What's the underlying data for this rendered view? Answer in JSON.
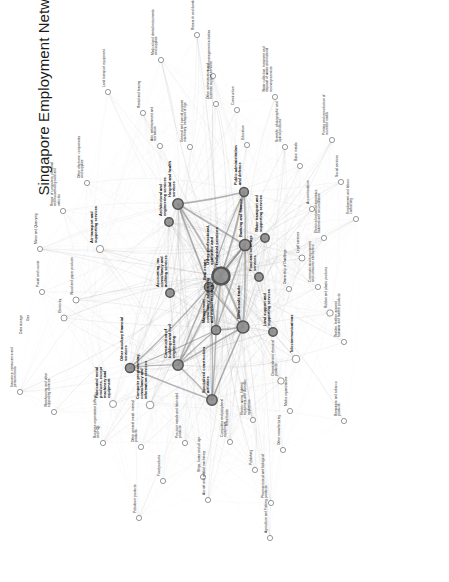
{
  "figure": {
    "title": "Singapore Employment Network",
    "background": "#ffffff",
    "width": 449,
    "height": 582,
    "title_rotation_deg": -90,
    "node_fill_large": "#8c8c8c",
    "node_fill_small": "#ffffff",
    "node_stroke": "#555555",
    "edge_color": "#9a9a9a",
    "label_color": "#111111"
  },
  "chart_data": {
    "type": "network",
    "title": "Singapore Employment Network",
    "layout": "force-directed",
    "grid": false,
    "legend": null,
    "xlabel": "",
    "ylabel": "",
    "node_count": 63,
    "nodes": [
      {
        "id": "prof_scientific",
        "label": "Other professional, scientific and technical services",
        "x": 221,
        "y": 276,
        "r": 8.5,
        "weight": 100,
        "emphasis": "big"
      },
      {
        "id": "hospital_health",
        "label": "Hospital and health services",
        "x": 178,
        "y": 204,
        "r": 5.2,
        "weight": 62,
        "emphasis": "mid"
      },
      {
        "id": "public_admin",
        "label": "Public administration and defence",
        "x": 244,
        "y": 192,
        "r": 4.4,
        "weight": 54,
        "emphasis": "mid"
      },
      {
        "id": "wholesale_trade",
        "label": "Wholesale trade",
        "x": 243,
        "y": 327,
        "r": 6.0,
        "weight": 78,
        "emphasis": "big"
      },
      {
        "id": "banking_finance",
        "label": "Banking and finance",
        "x": 245,
        "y": 245,
        "r": 5.6,
        "weight": 70,
        "emphasis": "mid"
      },
      {
        "id": "real_estate",
        "label": "Real estate",
        "x": 209,
        "y": 287,
        "r": 4.6,
        "weight": 52,
        "emphasis": "mid"
      },
      {
        "id": "mgmt_consultancy",
        "label": "Management consultancy, advertising and market research",
        "x": 216,
        "y": 330,
        "r": 4.6,
        "weight": 50,
        "emphasis": "mid"
      },
      {
        "id": "construction_buildings",
        "label": "Construction of buildings and civil engineering",
        "x": 178,
        "y": 365,
        "r": 5.2,
        "weight": 60,
        "emphasis": "mid"
      },
      {
        "id": "specialized_construction",
        "label": "Specialized construction activities",
        "x": 212,
        "y": 400,
        "r": 5.2,
        "weight": 58,
        "emphasis": "mid"
      },
      {
        "id": "other_aux_financial",
        "label": "Other auxiliary financial services",
        "x": 130,
        "y": 368,
        "r": 4.6,
        "weight": 48,
        "emphasis": "mid"
      },
      {
        "id": "architectural_eng",
        "label": "Architectural and engineering services",
        "x": 169,
        "y": 222,
        "r": 4.2,
        "weight": 44,
        "emphasis": "mid"
      },
      {
        "id": "accounting_tax",
        "label": "Accounting, tax consultancy and auditing services",
        "x": 170,
        "y": 293,
        "r": 4.2,
        "weight": 42,
        "emphasis": "mid"
      },
      {
        "id": "food_beverage",
        "label": "Food and beverage services",
        "x": 259,
        "y": 277,
        "r": 4.2,
        "weight": 42,
        "emphasis": "mid"
      },
      {
        "id": "water_transport",
        "label": "Water transport and supporting services",
        "x": 265,
        "y": 238,
        "r": 4.2,
        "weight": 40,
        "emphasis": "mid"
      },
      {
        "id": "land_support",
        "label": "Land support and supporting services",
        "x": 273,
        "y": 332,
        "r": 4.2,
        "weight": 40,
        "emphasis": "mid"
      },
      {
        "id": "telecommunications",
        "label": "Telecommunications",
        "x": 296,
        "y": 359,
        "r": 3.8,
        "weight": 36,
        "emphasis": "mid"
      },
      {
        "id": "computer_programming",
        "label": "Computer programming, consultancy and information services",
        "x": 150,
        "y": 405,
        "r": 3.8,
        "weight": 36,
        "emphasis": "mid"
      },
      {
        "id": "fabricated_metal",
        "label": "Fabricated metal products, except machinery and equipment",
        "x": 113,
        "y": 404,
        "r": 3.5,
        "weight": 30,
        "emphasis": "mid"
      },
      {
        "id": "air_transport",
        "label": "Air transport and supporting services",
        "x": 100,
        "y": 249,
        "r": 3.6,
        "weight": 32,
        "emphasis": "mid"
      },
      {
        "id": "rubber_plastic",
        "label": "Rubber and plastic products",
        "x": 330,
        "y": 313,
        "r": 3.2,
        "weight": 24,
        "emphasis": "small"
      },
      {
        "id": "chemicals",
        "label": "Chemicals and chemical products",
        "x": 281,
        "y": 381,
        "r": 3.2,
        "weight": 24,
        "emphasis": "small"
      },
      {
        "id": "legal_services",
        "label": "Legal services",
        "x": 302,
        "y": 258,
        "r": 3.0,
        "weight": 22,
        "emphasis": "small"
      },
      {
        "id": "electricity",
        "label": "Electricity",
        "x": 64,
        "y": 318,
        "r": 3.0,
        "weight": 20,
        "emphasis": "small"
      },
      {
        "id": "wood_paper",
        "label": "Wood and paper products",
        "x": 76,
        "y": 300,
        "r": 3.0,
        "weight": 20,
        "emphasis": "small"
      },
      {
        "id": "postal_courier",
        "label": "Postal and courier",
        "x": 42,
        "y": 292,
        "r": 2.6,
        "weight": 16,
        "emphasis": "small"
      },
      {
        "id": "mines_quarrying",
        "label": "Mines and Quarrying",
        "x": 40,
        "y": 249,
        "r": 2.6,
        "weight": 14,
        "emphasis": "small"
      },
      {
        "id": "repair_computers",
        "label": "Repair of computers, personal and household goods and vehicles",
        "x": 63,
        "y": 211,
        "r": 2.6,
        "weight": 14,
        "emphasis": "small"
      },
      {
        "id": "other_electronic",
        "label": "Other electronic components and supplies",
        "x": 87,
        "y": 183,
        "r": 2.6,
        "weight": 14,
        "emphasis": "small"
      },
      {
        "id": "land_transport_equipment",
        "label": "Land transport equipment",
        "x": 108,
        "y": 92,
        "r": 2.6,
        "weight": 14,
        "emphasis": "small"
      },
      {
        "id": "medical_dental",
        "label": "Medical and dental instruments and supplies",
        "x": 161,
        "y": 60,
        "r": 2.6,
        "weight": 14,
        "emphasis": "small"
      },
      {
        "id": "rental_leasing",
        "label": "Rental and leasing",
        "x": 143,
        "y": 113,
        "r": 2.6,
        "weight": 14,
        "emphasis": "small"
      },
      {
        "id": "arts_entertainment",
        "label": "Arts, entertainment and recreation",
        "x": 160,
        "y": 146,
        "r": 2.6,
        "weight": 14,
        "emphasis": "small"
      },
      {
        "id": "research_development",
        "label": "Research and development",
        "x": 197,
        "y": 35,
        "r": 2.6,
        "weight": 14,
        "emphasis": "small"
      },
      {
        "id": "fund_management",
        "label": "Fund management activities",
        "x": 213,
        "y": 76,
        "r": 2.6,
        "weight": 14,
        "emphasis": "small"
      },
      {
        "id": "other_admin_support",
        "label": "Other administrative and business support services",
        "x": 216,
        "y": 104,
        "r": 2.6,
        "weight": 14,
        "emphasis": "small"
      },
      {
        "id": "general_special_machinery",
        "label": "General and special purpose machinery, transport of rigs",
        "x": 190,
        "y": 147,
        "r": 2.6,
        "weight": 14,
        "emphasis": "small"
      },
      {
        "id": "construction_misc",
        "label": "Construction",
        "x": 237,
        "y": 110,
        "r": 2.6,
        "weight": 14,
        "emphasis": "small"
      },
      {
        "id": "education",
        "label": "Education",
        "x": 247,
        "y": 145,
        "r": 2.6,
        "weight": 14,
        "emphasis": "small"
      },
      {
        "id": "water_collection",
        "label": "Water collection, treatment and disposal of waste and material recovery services",
        "x": 275,
        "y": 97,
        "r": 2.6,
        "weight": 14,
        "emphasis": "small"
      },
      {
        "id": "scientific_photographic",
        "label": "Scientific, photographic and optical products",
        "x": 285,
        "y": 147,
        "r": 2.6,
        "weight": 14,
        "emphasis": "small"
      },
      {
        "id": "basic_metals",
        "label": "Basic metals",
        "x": 300,
        "y": 166,
        "r": 2.6,
        "weight": 14,
        "emphasis": "small"
      },
      {
        "id": "printing_reproduction",
        "label": "Printing and reproduction of recorded media",
        "x": 332,
        "y": 140,
        "r": 2.6,
        "weight": 14,
        "emphasis": "small"
      },
      {
        "id": "social_services",
        "label": "Social services",
        "x": 341,
        "y": 182,
        "r": 2.6,
        "weight": 14,
        "emphasis": "small"
      },
      {
        "id": "accommodation",
        "label": "Accommodation",
        "x": 312,
        "y": 209,
        "r": 2.6,
        "weight": 14,
        "emphasis": "small"
      },
      {
        "id": "electrical_industrial",
        "label": "Electrical industrial apparatus, batteries and accumulators",
        "x": 324,
        "y": 238,
        "r": 2.6,
        "weight": 14,
        "emphasis": "small"
      },
      {
        "id": "employment_labour",
        "label": "Employment and labour contracting",
        "x": 356,
        "y": 219,
        "r": 2.6,
        "weight": 14,
        "emphasis": "small"
      },
      {
        "id": "communications_equipment",
        "label": "Communications equipment and consumer electronics",
        "x": 318,
        "y": 287,
        "r": 2.6,
        "weight": 14,
        "emphasis": "small"
      },
      {
        "id": "ownership_dwellings",
        "label": "Ownership of Dwellings",
        "x": 289,
        "y": 289,
        "r": 2.6,
        "weight": 14,
        "emphasis": "small"
      },
      {
        "id": "textiles_leather",
        "label": "Textiles, leather, apparel, footwear and leather products",
        "x": 344,
        "y": 342,
        "r": 2.6,
        "weight": 14,
        "emphasis": "small"
      },
      {
        "id": "beverages_tobacco",
        "label": "Beverages and tobacco products",
        "x": 344,
        "y": 421,
        "r": 2.6,
        "weight": 14,
        "emphasis": "small"
      },
      {
        "id": "media_organizations",
        "label": "Media organizations",
        "x": 290,
        "y": 411,
        "r": 2.6,
        "weight": 14,
        "emphasis": "small"
      },
      {
        "id": "electric_wiring",
        "label": "Electric wiring, lighting equipment and domestic appliances",
        "x": 253,
        "y": 420,
        "r": 2.6,
        "weight": 14,
        "emphasis": "small"
      },
      {
        "id": "computers_peripheral",
        "label": "Computers and peripheral equipment",
        "x": 230,
        "y": 442,
        "r": 2.6,
        "weight": 14,
        "emphasis": "small"
      },
      {
        "id": "publishing",
        "label": "Publishing",
        "x": 255,
        "y": 470,
        "r": 2.6,
        "weight": 14,
        "emphasis": "small"
      },
      {
        "id": "other_manufacturing",
        "label": "Other manufacturing",
        "x": 283,
        "y": 450,
        "r": 2.6,
        "weight": 14,
        "emphasis": "small"
      },
      {
        "id": "pharmaceutical",
        "label": "Pharmaceutical and biological products",
        "x": 271,
        "y": 503,
        "r": 2.6,
        "weight": 14,
        "emphasis": "small"
      },
      {
        "id": "agriculture_fishing",
        "label": "Agriculture and Fishing",
        "x": 270,
        "y": 538,
        "r": 2.6,
        "weight": 14,
        "emphasis": "small"
      },
      {
        "id": "aircraft_machinery",
        "label": "Aircraft and related machinery",
        "x": 208,
        "y": 500,
        "r": 2.6,
        "weight": 14,
        "emphasis": "small"
      },
      {
        "id": "ships_rigs",
        "label": "Ships, boats and oil rigs",
        "x": 203,
        "y": 477,
        "r": 2.6,
        "weight": 14,
        "emphasis": "small"
      },
      {
        "id": "precious_metals",
        "label": "Precious metals and fabricated products",
        "x": 185,
        "y": 443,
        "r": 2.6,
        "weight": 14,
        "emphasis": "small"
      },
      {
        "id": "food_products",
        "label": "Food products",
        "x": 163,
        "y": 481,
        "r": 2.6,
        "weight": 14,
        "emphasis": "small"
      },
      {
        "id": "petroleum_products",
        "label": "Petroleum products",
        "x": 139,
        "y": 518,
        "r": 2.6,
        "weight": 14,
        "emphasis": "small"
      },
      {
        "id": "other_mineral_products",
        "label": "Other general metal, mineral products",
        "x": 141,
        "y": 447,
        "r": 2.6,
        "weight": 14,
        "emphasis": "small"
      },
      {
        "id": "business_org_hq",
        "label": "Business organization (offices and HQ)",
        "x": 103,
        "y": 443,
        "r": 2.6,
        "weight": 14,
        "emphasis": "small"
      },
      {
        "id": "warehousing",
        "label": "Warehousing and other supporting services",
        "x": 54,
        "y": 412,
        "r": 2.6,
        "weight": 14,
        "emphasis": "small"
      },
      {
        "id": "insurance_pension",
        "label": "Insurance, reinsurance and pension funds",
        "x": 20,
        "y": 392,
        "r": 2.6,
        "weight": 14,
        "emphasis": "small"
      },
      {
        "id": "retail_trade",
        "label": "Retail trade",
        "x": 231,
        "y": 428,
        "r": 0,
        "weight": 0,
        "emphasis": "small"
      },
      {
        "id": "data_storage",
        "label": "Data storage",
        "x": 25,
        "y": 336,
        "r": 0,
        "weight": 0,
        "emphasis": "small"
      },
      {
        "id": "gas_supply",
        "label": "Gas",
        "x": 32,
        "y": 323,
        "r": 0,
        "weight": 0,
        "emphasis": "small"
      }
    ],
    "edge_count": 640
  }
}
